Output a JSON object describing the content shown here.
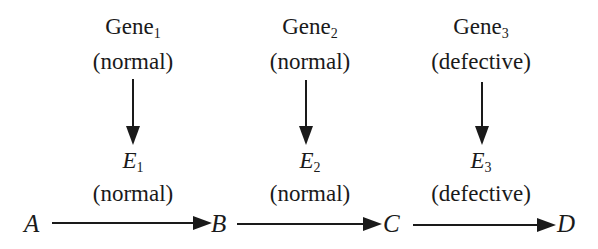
{
  "columns": [
    {
      "gene": "Gene",
      "gene_sub": "1",
      "gene_state": "(normal)",
      "enzyme": "E",
      "enzyme_sub": "1",
      "enzyme_state": "(normal)",
      "cx": 133
    },
    {
      "gene": "Gene",
      "gene_sub": "2",
      "gene_state": "(normal)",
      "enzyme": "E",
      "enzyme_sub": "2",
      "enzyme_state": "(normal)",
      "cx": 310
    },
    {
      "gene": "Gene",
      "gene_sub": "3",
      "gene_state": "(defective)",
      "enzyme": "E",
      "enzyme_sub": "3",
      "enzyme_state": "(defective)",
      "cx": 481
    }
  ],
  "pathway": {
    "nodes": [
      "A",
      "B",
      "C",
      "D"
    ],
    "edges": [
      {
        "from": "A",
        "to": "B",
        "catalyzed_by": "E1"
      },
      {
        "from": "B",
        "to": "C",
        "catalyzed_by": "E2"
      },
      {
        "from": "C",
        "to": "D",
        "catalyzed_by": "E3"
      }
    ]
  },
  "colors": {
    "ink": "#1a1a1a",
    "background": "#ffffff"
  }
}
